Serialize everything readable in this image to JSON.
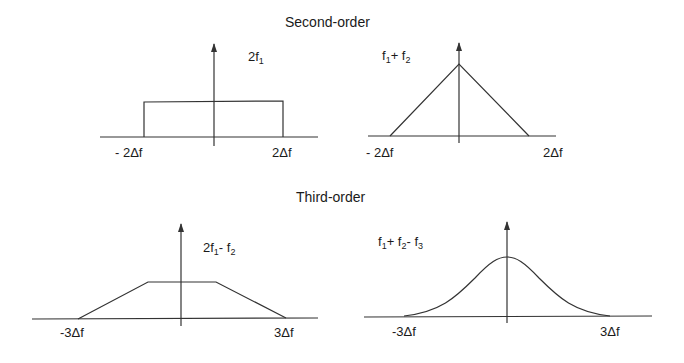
{
  "titles": {
    "second_order": "Second-order",
    "third_order": "Third-order"
  },
  "panels": [
    {
      "name": "2f1",
      "label_main": "2f",
      "label_sub": "1",
      "shape": "rectangle",
      "x_left": "- 2Δf",
      "x_right": "2Δf"
    },
    {
      "name": "f1+f2",
      "label_parts": [
        "f",
        "1",
        "+ f",
        "2"
      ],
      "shape": "triangle",
      "x_left": "- 2Δf",
      "x_right": "2Δf"
    },
    {
      "name": "2f1-f2",
      "label_parts": [
        "2f",
        "1",
        "- f",
        "2"
      ],
      "shape": "trapezoid",
      "x_left": "-3Δf",
      "x_right": "3Δf"
    },
    {
      "name": "f1+f2-f3",
      "label_parts": [
        "f",
        "1",
        "+ f",
        "2",
        "- f",
        "3"
      ],
      "shape": "bell",
      "x_left": "-3Δf",
      "x_right": "3Δf"
    }
  ],
  "colors": {
    "line": "#333333",
    "background": "#ffffff"
  }
}
